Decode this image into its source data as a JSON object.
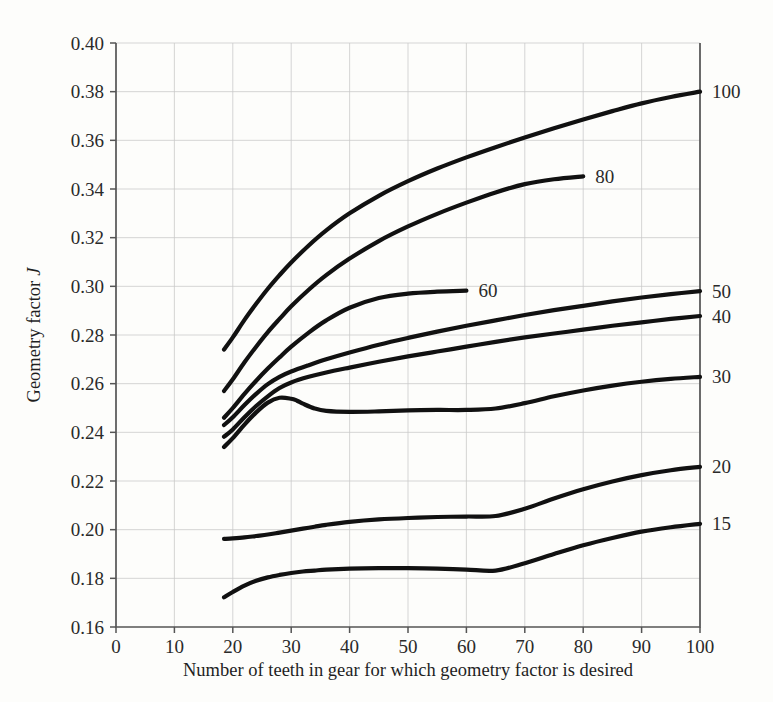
{
  "chart_data": {
    "type": "line",
    "title": "",
    "xlabel": "Number of teeth in gear for which geometry factor is desired",
    "ylabel": "Geometry factor J",
    "ylabel_plain": "Geometry factor",
    "ylabel_symbol": "J",
    "xlim": [
      0,
      100
    ],
    "ylim": [
      0.16,
      0.4
    ],
    "xticks": [
      0,
      10,
      20,
      30,
      40,
      50,
      60,
      70,
      80,
      90,
      100
    ],
    "xtick_labels": [
      "0",
      "10",
      "20",
      "30",
      "40",
      "50",
      "60",
      "70",
      "80",
      "90",
      "100"
    ],
    "yticks": [
      0.16,
      0.18,
      0.2,
      0.22,
      0.24,
      0.26,
      0.28,
      0.3,
      0.32,
      0.34,
      0.36,
      0.38,
      0.4
    ],
    "ytick_labels": [
      "0.16",
      "0.18",
      "0.20",
      "0.22",
      "0.24",
      "0.26",
      "0.28",
      "0.30",
      "0.32",
      "0.34",
      "0.36",
      "0.38",
      "0.40"
    ],
    "grid": true,
    "legend_position": "inline-curve-end-labels",
    "line_color": "#111111",
    "grid_color": "#c9c9c9",
    "axis_color": "#555555",
    "background_color": "#fdfdfb",
    "series": [
      {
        "name": "100",
        "label": "100",
        "label_position": "right-end",
        "x": [
          18.5,
          20,
          22,
          24,
          26,
          28,
          30,
          33,
          36,
          40,
          45,
          50,
          55,
          60,
          65,
          70,
          75,
          80,
          85,
          90,
          95,
          100
        ],
        "y": [
          0.274,
          0.279,
          0.2862,
          0.2928,
          0.299,
          0.3046,
          0.3098,
          0.3168,
          0.323,
          0.33,
          0.3372,
          0.3432,
          0.3484,
          0.353,
          0.3572,
          0.3612,
          0.365,
          0.3686,
          0.372,
          0.3752,
          0.3778,
          0.38
        ]
      },
      {
        "name": "80",
        "label": "80",
        "label_position": "inline-end",
        "x": [
          18.5,
          20,
          22,
          24,
          26,
          28,
          30,
          33,
          36,
          40,
          45,
          50,
          55,
          60,
          65,
          70,
          75,
          80
        ],
        "y": [
          0.257,
          0.2618,
          0.2688,
          0.2752,
          0.2812,
          0.2866,
          0.2918,
          0.2986,
          0.3046,
          0.3114,
          0.3186,
          0.3246,
          0.3298,
          0.3344,
          0.3386,
          0.342,
          0.344,
          0.3452
        ]
      },
      {
        "name": "60",
        "label": "60",
        "label_position": "inline-end",
        "x": [
          18.5,
          20,
          22,
          24,
          26,
          28,
          30,
          33,
          36,
          40,
          45,
          50,
          55,
          60
        ],
        "y": [
          0.246,
          0.25,
          0.2558,
          0.2612,
          0.2662,
          0.2708,
          0.2752,
          0.281,
          0.286,
          0.2912,
          0.2952,
          0.297,
          0.2978,
          0.2982
        ]
      },
      {
        "name": "50",
        "label": "50",
        "label_position": "right-end",
        "x": [
          18.5,
          20,
          22,
          24,
          26,
          28,
          30,
          33,
          36,
          40,
          45,
          50,
          55,
          60,
          65,
          70,
          75,
          80,
          85,
          90,
          95,
          100
        ],
        "y": [
          0.243,
          0.2462,
          0.2512,
          0.2558,
          0.2598,
          0.2628,
          0.265,
          0.2676,
          0.27,
          0.2728,
          0.276,
          0.2788,
          0.2814,
          0.2838,
          0.286,
          0.2882,
          0.2902,
          0.292,
          0.2938,
          0.2954,
          0.2968,
          0.298
        ]
      },
      {
        "name": "40",
        "label": "40",
        "label_position": "right-end",
        "x": [
          18.5,
          20,
          22,
          24,
          26,
          28,
          30,
          33,
          36,
          40,
          45,
          50,
          55,
          60,
          65,
          70,
          75,
          80,
          85,
          90,
          95,
          100
        ],
        "y": [
          0.2382,
          0.2412,
          0.2462,
          0.2508,
          0.2548,
          0.2582,
          0.2605,
          0.2628,
          0.2646,
          0.2666,
          0.269,
          0.2712,
          0.2732,
          0.2752,
          0.2772,
          0.279,
          0.2806,
          0.2822,
          0.2838,
          0.2852,
          0.2866,
          0.2878
        ]
      },
      {
        "name": "30",
        "label": "30",
        "label_position": "right-end",
        "x": [
          18.5,
          20,
          22,
          24,
          26,
          28,
          30,
          31,
          32,
          34,
          36,
          40,
          45,
          50,
          55,
          60,
          65,
          70,
          75,
          80,
          85,
          90,
          95,
          100
        ],
        "y": [
          0.234,
          0.2376,
          0.2432,
          0.2482,
          0.2522,
          0.2542,
          0.2538,
          0.253,
          0.2518,
          0.2498,
          0.2488,
          0.2484,
          0.2486,
          0.249,
          0.2492,
          0.2492,
          0.2498,
          0.252,
          0.2548,
          0.2572,
          0.2592,
          0.2608,
          0.262,
          0.2628
        ]
      },
      {
        "name": "20",
        "label": "20",
        "label_position": "right-end",
        "x": [
          18.5,
          20,
          22,
          24,
          26,
          28,
          30,
          32,
          34,
          36,
          40,
          45,
          50,
          55,
          60,
          65,
          70,
          75,
          80,
          85,
          90,
          95,
          100
        ],
        "y": [
          0.1962,
          0.1964,
          0.1968,
          0.1974,
          0.198,
          0.1988,
          0.1996,
          0.2004,
          0.2012,
          0.202,
          0.2032,
          0.2042,
          0.2048,
          0.2052,
          0.2054,
          0.2056,
          0.2086,
          0.2128,
          0.2166,
          0.2198,
          0.2224,
          0.2244,
          0.2258
        ]
      },
      {
        "name": "15",
        "label": "15",
        "label_position": "right-end",
        "x": [
          18.5,
          20,
          22,
          24,
          26,
          28,
          30,
          32,
          34,
          36,
          40,
          45,
          50,
          55,
          60,
          65,
          70,
          75,
          80,
          85,
          90,
          95,
          100
        ],
        "y": [
          0.1722,
          0.1744,
          0.177,
          0.179,
          0.1804,
          0.1814,
          0.1822,
          0.1828,
          0.1832,
          0.1836,
          0.184,
          0.1842,
          0.1842,
          0.184,
          0.1836,
          0.1832,
          0.1862,
          0.19,
          0.1936,
          0.1966,
          0.1992,
          0.201,
          0.2024
        ]
      }
    ]
  }
}
